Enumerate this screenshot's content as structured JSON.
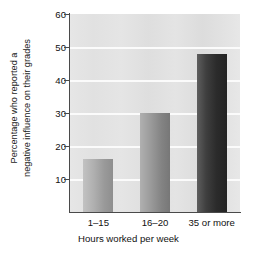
{
  "chart_data": {
    "type": "bar",
    "title": "",
    "subtitle": "",
    "categories": [
      "1–15",
      "16–20",
      "35 or more"
    ],
    "values": [
      16,
      30,
      48
    ],
    "series": [
      {
        "name": "Percentage who reported a negative influence on their grades",
        "values": [
          16,
          30,
          48
        ]
      }
    ],
    "xlabel": "Hours worked per week",
    "ylabel": "Percentage who reported a negative influence on their grades",
    "ylabel_lines": [
      "Percentage who reported a",
      "negative influence on their grades"
    ],
    "ylim": [
      0,
      60
    ],
    "yticks": [
      10,
      20,
      30,
      40,
      50,
      60
    ],
    "ytick_labels": [
      "10",
      "20",
      "30",
      "40",
      "50",
      "60"
    ],
    "gridlines": {
      "horizontal": true,
      "vertical": false,
      "values": [
        10,
        20,
        30,
        40,
        50
      ],
      "color": "#fbfbfb"
    },
    "legend": {
      "visible": false,
      "position": "none",
      "entries": []
    },
    "bar_colors": [
      "#a8a8a8",
      "#949494",
      "#2e2e2e"
    ],
    "plot_background": "#e3e3e3",
    "figure_background": "#ffffff",
    "axis_color": "#4a4a4a",
    "text_color": "#111111"
  }
}
